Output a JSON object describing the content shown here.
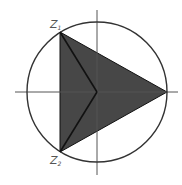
{
  "diagram": {
    "type": "complex-plane-geometry",
    "circle": {
      "cx": 97,
      "cy": 92,
      "r": 70,
      "stroke": "#333333"
    },
    "axes": {
      "x": {
        "x1": 15,
        "x2": 178,
        "y": 92,
        "stroke": "#555555"
      },
      "y": {
        "y1": 10,
        "y2": 175,
        "x": 97,
        "stroke": "#555555"
      }
    },
    "triangle": {
      "fill": "#474747",
      "vertices": [
        {
          "name": "Z1",
          "x": 60,
          "y": 32
        },
        {
          "name": "Z2",
          "x": 60,
          "y": 152
        },
        {
          "name": "Z3",
          "x": 167,
          "y": 92
        }
      ]
    },
    "center_lines": [
      {
        "from": "Z1",
        "to": "origin"
      },
      {
        "from": "Z2",
        "to": "origin"
      }
    ],
    "labels": [
      {
        "id": "z1",
        "main": "Z",
        "sub": "1",
        "x": 50,
        "y": 28
      },
      {
        "id": "z2",
        "main": "Z",
        "sub": "2",
        "x": 50,
        "y": 164
      }
    ]
  }
}
